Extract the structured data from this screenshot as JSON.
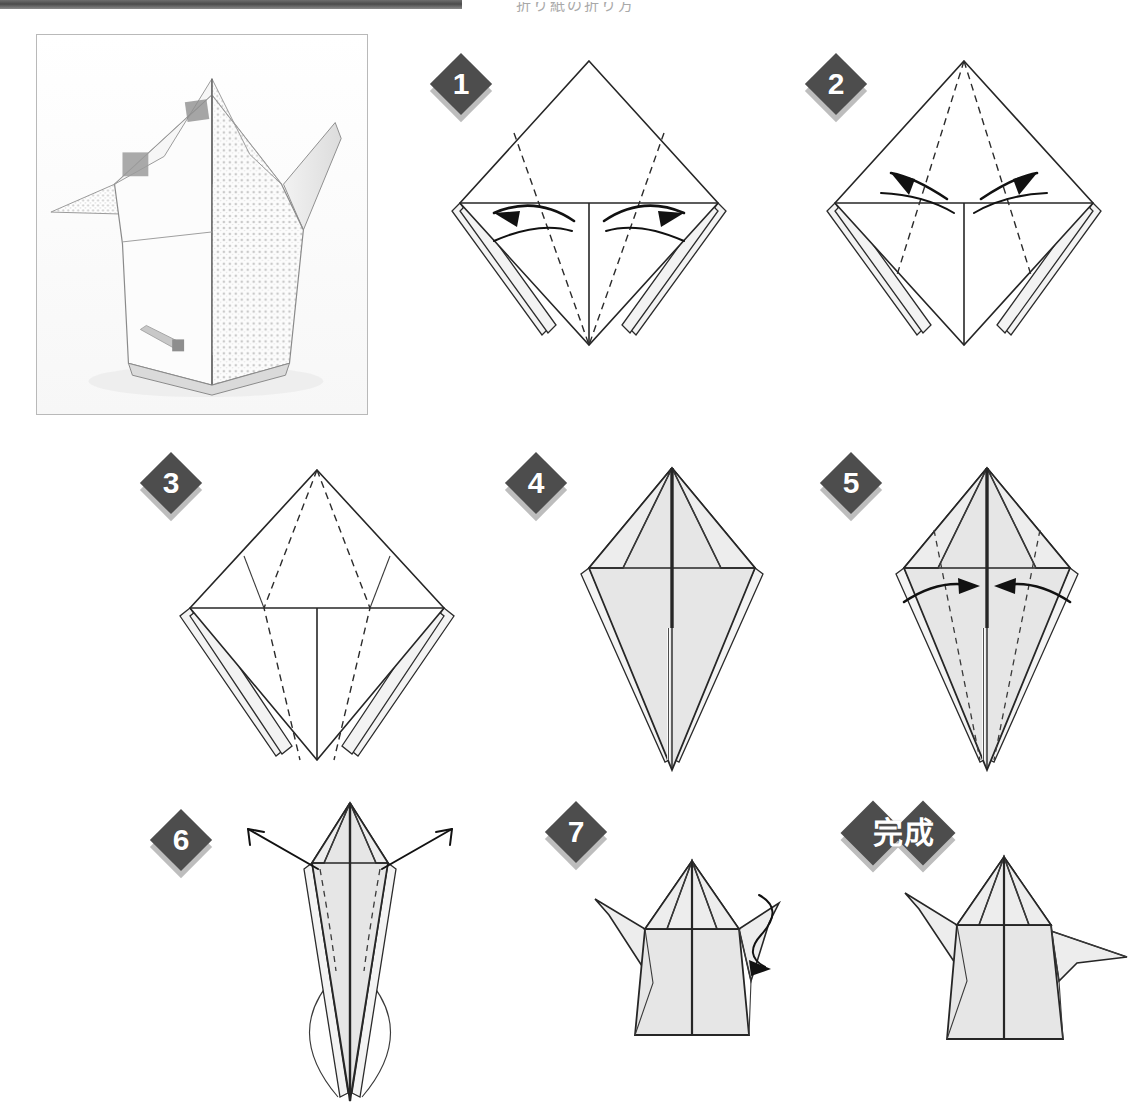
{
  "document": {
    "type": "origami-instruction-sheet",
    "header_partial_text": "折り紙の折り方",
    "finish_label": "完成"
  },
  "photo": {
    "caption": "",
    "alt_name": "finished-origami-photo",
    "description": "photograph of the completed origami model folded from patterned washi paper"
  },
  "steps": [
    {
      "number": "1",
      "badge_label": "1",
      "name": "step-1",
      "has_arrows": true,
      "arrow_direction": "outward",
      "arrow_count": 2,
      "shape": "square-diamond"
    },
    {
      "number": "2",
      "badge_label": "2",
      "name": "step-2",
      "has_arrows": true,
      "arrow_direction": "outward",
      "arrow_count": 2,
      "shape": "square-diamond"
    },
    {
      "number": "3",
      "badge_label": "3",
      "name": "step-3",
      "has_arrows": false,
      "arrow_direction": "none",
      "arrow_count": 0,
      "shape": "square-diamond"
    },
    {
      "number": "4",
      "badge_label": "4",
      "name": "step-4",
      "has_arrows": false,
      "arrow_direction": "none",
      "arrow_count": 0,
      "shape": "kite"
    },
    {
      "number": "5",
      "badge_label": "5",
      "name": "step-5",
      "has_arrows": true,
      "arrow_direction": "inward",
      "arrow_count": 2,
      "shape": "kite"
    },
    {
      "number": "6",
      "badge_label": "6",
      "name": "step-6",
      "has_arrows": true,
      "arrow_direction": "outward-up",
      "arrow_count": 2,
      "shape": "narrow-cone"
    },
    {
      "number": "7",
      "badge_label": "7",
      "name": "step-7",
      "has_arrows": true,
      "arrow_direction": "curl-right",
      "arrow_count": 1,
      "shape": "three-d-helmet"
    },
    {
      "number": "完成",
      "badge_label": "完成",
      "name": "step-finish",
      "has_arrows": false,
      "arrow_direction": "none",
      "arrow_count": 0,
      "shape": "three-d-helmet-final"
    }
  ],
  "colors": {
    "badge_fill": "#4d4d4d",
    "badge_shadow": "#bdbdbd",
    "badge_text": "#ffffff",
    "line": "#262626",
    "paper_fill": "#e6e6e6",
    "background": "#ffffff",
    "photo_border": "#b9b9b9",
    "header_bar": "#4a4a4a"
  }
}
